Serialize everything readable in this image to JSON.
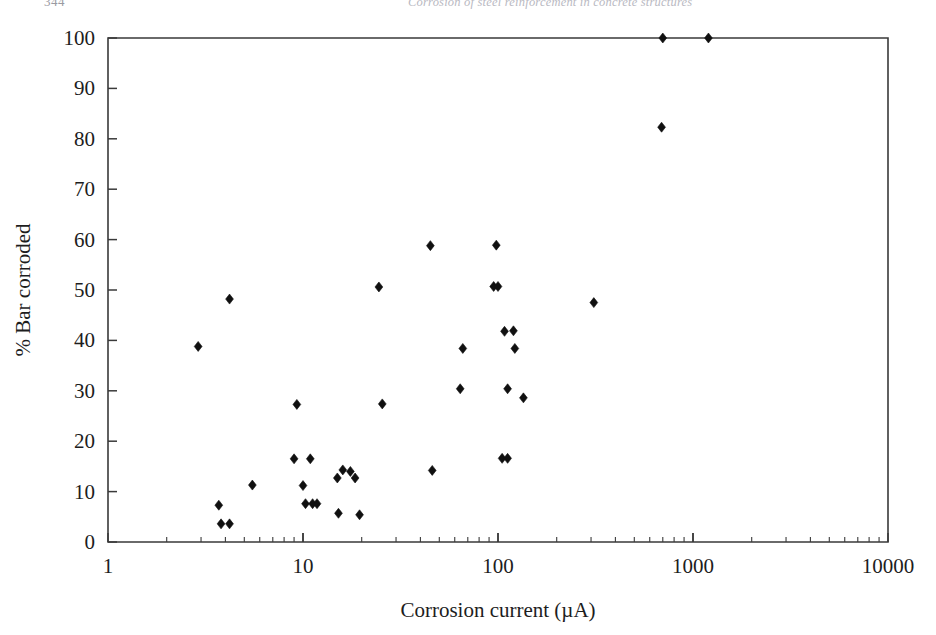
{
  "running_head": {
    "page_number": "344",
    "title": "Corrosion of steel reinforcement in concrete structures"
  },
  "figure": {
    "x_axis_label": "Corrosion current (µA)",
    "y_axis_label": "% Bar corroded",
    "x_tick_labels": [
      "1",
      "10",
      "100",
      "1000",
      "10000"
    ],
    "y_tick_labels": [
      "0",
      "10",
      "20",
      "30",
      "40",
      "50",
      "60",
      "70",
      "80",
      "90",
      "100"
    ],
    "marker_color": "#101010",
    "axis_color": "#3a3a3a"
  },
  "chart_data": {
    "type": "scatter",
    "title": "",
    "xlabel": "Corrosion current (µA)",
    "ylabel": "% Bar corroded",
    "xscale": "log",
    "xlim": [
      1,
      10000
    ],
    "ylim": [
      0,
      100
    ],
    "xticks": [
      1,
      10,
      100,
      1000,
      10000
    ],
    "yticks": [
      0,
      10,
      20,
      30,
      40,
      50,
      60,
      70,
      80,
      90,
      100
    ],
    "grid": false,
    "legend": null,
    "series": [
      {
        "name": "Bar corrosion vs corrosion current",
        "marker": "diamond",
        "points": [
          [
            2.9,
            38.8
          ],
          [
            3.7,
            7.3
          ],
          [
            3.8,
            3.6
          ],
          [
            4.2,
            3.6
          ],
          [
            4.2,
            48.2
          ],
          [
            5.5,
            11.3
          ],
          [
            9.0,
            16.5
          ],
          [
            9.3,
            27.3
          ],
          [
            10.0,
            11.2
          ],
          [
            10.3,
            7.6
          ],
          [
            10.9,
            16.5
          ],
          [
            11.2,
            7.6
          ],
          [
            11.8,
            7.6
          ],
          [
            15.0,
            12.7
          ],
          [
            15.2,
            5.7
          ],
          [
            16.0,
            14.3
          ],
          [
            17.5,
            14.0
          ],
          [
            18.5,
            12.7
          ],
          [
            19.5,
            5.4
          ],
          [
            24.5,
            50.6
          ],
          [
            25.5,
            27.4
          ],
          [
            45.0,
            58.8
          ],
          [
            46.0,
            14.2
          ],
          [
            64.0,
            30.4
          ],
          [
            66.0,
            38.4
          ],
          [
            95.0,
            50.7
          ],
          [
            100.0,
            50.7
          ],
          [
            98.0,
            58.9
          ],
          [
            105.0,
            16.6
          ],
          [
            112.0,
            16.6
          ],
          [
            108.0,
            41.8
          ],
          [
            112.0,
            30.4
          ],
          [
            120.0,
            41.9
          ],
          [
            122.0,
            38.4
          ],
          [
            135.0,
            28.6
          ],
          [
            310.0,
            47.5
          ],
          [
            690.0,
            82.3
          ],
          [
            700.0,
            100.0
          ],
          [
            1200.0,
            100.0
          ]
        ]
      }
    ]
  }
}
